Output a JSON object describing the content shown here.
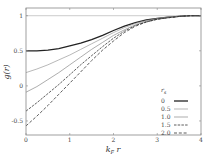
{
  "chart_data": {
    "type": "line",
    "title": "",
    "xlabel": "k_F r",
    "ylabel": "g(r)",
    "xlim": [
      0,
      4
    ],
    "ylim": [
      -0.7,
      1.11
    ],
    "grid": false,
    "reference_line_y": 1,
    "xticks": [
      0,
      1,
      2,
      3,
      4
    ],
    "yticks": [
      -0.5,
      0,
      0.5,
      1
    ],
    "xtick_labels": [
      "0",
      "1",
      "2",
      "3",
      "4"
    ],
    "ytick_labels": [
      "-0.5",
      "0",
      "0.5",
      "1"
    ],
    "legend": {
      "title": "r_s",
      "position": "lower right"
    },
    "x": [
      0,
      0.25,
      0.5,
      0.75,
      1.0,
      1.25,
      1.5,
      1.75,
      2.0,
      2.25,
      2.5,
      2.75,
      3.0,
      3.25,
      3.5,
      3.75,
      4.0
    ],
    "series": [
      {
        "name": "0",
        "style": "solid",
        "color": "#222222",
        "width": 1.3,
        "values": [
          0.5,
          0.5,
          0.51,
          0.53,
          0.57,
          0.61,
          0.66,
          0.72,
          0.79,
          0.85,
          0.9,
          0.94,
          0.96,
          0.98,
          0.99,
          1.0,
          1.0
        ]
      },
      {
        "name": "0.5",
        "style": "solid",
        "color": "#9a9a9a",
        "width": 0.7,
        "values": [
          0.19,
          0.24,
          0.3,
          0.37,
          0.44,
          0.52,
          0.6,
          0.68,
          0.76,
          0.83,
          0.89,
          0.93,
          0.96,
          0.98,
          0.99,
          1.0,
          1.0
        ]
      },
      {
        "name": "1.0",
        "style": "solid",
        "color": "#8a8a8a",
        "width": 0.7,
        "values": [
          -0.09,
          -0.01,
          0.09,
          0.19,
          0.3,
          0.41,
          0.52,
          0.62,
          0.72,
          0.8,
          0.87,
          0.92,
          0.95,
          0.98,
          0.99,
          1.0,
          1.0
        ]
      },
      {
        "name": "1.5",
        "style": "dashed",
        "color": "#333333",
        "width": 0.8,
        "values": [
          -0.36,
          -0.24,
          -0.11,
          0.02,
          0.16,
          0.3,
          0.43,
          0.56,
          0.68,
          0.78,
          0.86,
          0.91,
          0.95,
          0.97,
          0.99,
          1.0,
          1.0
        ]
      },
      {
        "name": "2.0",
        "style": "dashed",
        "color": "#333333",
        "width": 0.8,
        "values": [
          -0.57,
          -0.43,
          -0.28,
          -0.12,
          0.04,
          0.2,
          0.36,
          0.51,
          0.64,
          0.76,
          0.85,
          0.91,
          0.95,
          0.97,
          0.99,
          1.0,
          1.0
        ]
      }
    ]
  }
}
